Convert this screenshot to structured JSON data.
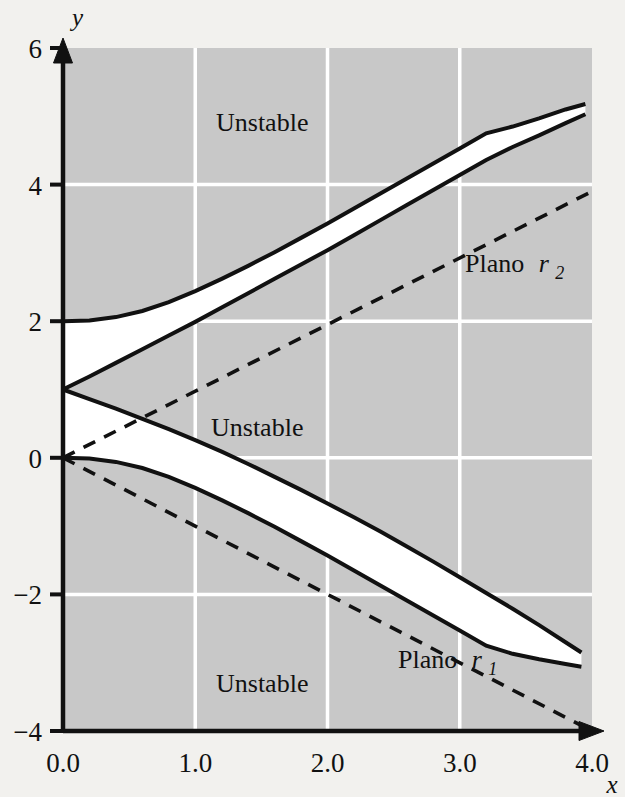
{
  "figure": {
    "background_color": "#f2f1ee",
    "plot_background_color": "#c8c8c8",
    "grid_color": "#ffffff",
    "line_color": "#111111",
    "stable_region_color": "#ffffff"
  },
  "axes": {
    "x_label": "x",
    "y_label": "y",
    "x_ticks": [
      "0.0",
      "1.0",
      "2.0",
      "3.0",
      "4.0"
    ],
    "y_ticks": [
      "6",
      "4",
      "2",
      "0",
      "−2",
      "−4"
    ]
  },
  "labels": {
    "unstable_top": "Unstable",
    "unstable_middle": "Unstable",
    "unstable_bottom": "Unstable",
    "plano_r2_text": "Plano",
    "plano_r2_var": "r",
    "plano_r2_sub": "2",
    "plano_r1_text": "Plano",
    "plano_r1_var": "r",
    "plano_r1_sub": "1"
  },
  "chart_data": {
    "type": "line",
    "title": "",
    "xlabel": "x",
    "ylabel": "y",
    "xlim": [
      0.0,
      4.0
    ],
    "ylim": [
      -4,
      6
    ],
    "xticks": [
      0.0,
      1.0,
      2.0,
      3.0,
      4.0
    ],
    "yticks": [
      6,
      4,
      2,
      0,
      -2,
      -4
    ],
    "grid": true,
    "gridlines_x": [
      1.0,
      2.0,
      3.0
    ],
    "gridlines_y": [
      4,
      2,
      0,
      -2
    ],
    "legend": "none",
    "annotations": [
      {
        "text": "Unstable",
        "x": 1.15,
        "y": 5.1
      },
      {
        "text": "Unstable",
        "x": 1.1,
        "y": 0.7
      },
      {
        "text": "Unstable",
        "x": 1.15,
        "y": -3.15
      },
      {
        "text": "Plano r2",
        "x": 3.05,
        "y": 2.75
      },
      {
        "text": "Plano r1",
        "x": 2.55,
        "y": -2.6
      }
    ],
    "series": [
      {
        "name": "upper stable boundary (upper branch)",
        "style": "solid",
        "x": [
          0.0,
          0.2,
          0.4,
          0.6,
          0.8,
          1.0,
          1.2,
          1.4,
          1.6,
          1.8,
          2.0,
          2.2,
          2.4,
          2.6,
          2.8,
          3.0,
          3.2,
          3.4,
          3.6,
          3.8,
          3.95
        ],
        "y": [
          2.0,
          2.01,
          2.06,
          2.15,
          2.28,
          2.44,
          2.62,
          2.81,
          3.01,
          3.22,
          3.43,
          3.65,
          3.87,
          4.09,
          4.31,
          4.53,
          4.75,
          4.85,
          4.97,
          5.1,
          5.18
        ]
      },
      {
        "name": "upper stable boundary (lower branch)",
        "style": "solid",
        "x": [
          0.0,
          0.2,
          0.4,
          0.6,
          0.8,
          1.0,
          1.2,
          1.4,
          1.6,
          1.8,
          2.0,
          2.2,
          2.4,
          2.6,
          2.8,
          3.0,
          3.2,
          3.4,
          3.6,
          3.8,
          3.95
        ],
        "y": [
          1.0,
          1.19,
          1.39,
          1.59,
          1.79,
          1.99,
          2.2,
          2.41,
          2.62,
          2.83,
          3.04,
          3.26,
          3.48,
          3.7,
          3.92,
          4.14,
          4.36,
          4.55,
          4.72,
          4.9,
          5.03
        ]
      },
      {
        "name": "lower stable boundary (upper branch)",
        "style": "solid",
        "x": [
          0.0,
          0.2,
          0.4,
          0.6,
          0.8,
          1.0,
          1.2,
          1.4,
          1.6,
          1.8,
          2.0,
          2.2,
          2.4,
          2.6,
          2.8,
          3.0,
          3.2,
          3.4,
          3.6,
          3.8,
          3.92
        ],
        "y": [
          1.0,
          0.86,
          0.72,
          0.57,
          0.42,
          0.26,
          0.09,
          -0.09,
          -0.28,
          -0.47,
          -0.67,
          -0.87,
          -1.08,
          -1.3,
          -1.52,
          -1.75,
          -1.98,
          -2.21,
          -2.45,
          -2.7,
          -2.85
        ]
      },
      {
        "name": "lower stable boundary (lower branch)",
        "style": "solid",
        "x": [
          0.0,
          0.2,
          0.4,
          0.6,
          0.8,
          1.0,
          1.2,
          1.4,
          1.6,
          1.8,
          2.0,
          2.2,
          2.4,
          2.6,
          2.8,
          3.0,
          3.2,
          3.4,
          3.6,
          3.8,
          3.92
        ],
        "y": [
          0.0,
          -0.01,
          -0.06,
          -0.15,
          -0.28,
          -0.44,
          -0.62,
          -0.81,
          -1.01,
          -1.22,
          -1.43,
          -1.65,
          -1.87,
          -2.09,
          -2.31,
          -2.53,
          -2.75,
          -2.87,
          -2.95,
          -3.02,
          -3.06
        ]
      },
      {
        "name": "Plano r2",
        "style": "dashed",
        "x": [
          0.0,
          4.0
        ],
        "y": [
          0.0,
          3.9
        ]
      },
      {
        "name": "Plano r1",
        "style": "dashed",
        "x": [
          0.0,
          4.0
        ],
        "y": [
          0.0,
          -4.0
        ]
      }
    ],
    "regions": [
      {
        "name": "Unstable",
        "fill": "#c8c8c8"
      },
      {
        "name": "Stable (upper wedge)",
        "fill": "#ffffff"
      },
      {
        "name": "Stable (lower wedge)",
        "fill": "#ffffff"
      }
    ]
  }
}
